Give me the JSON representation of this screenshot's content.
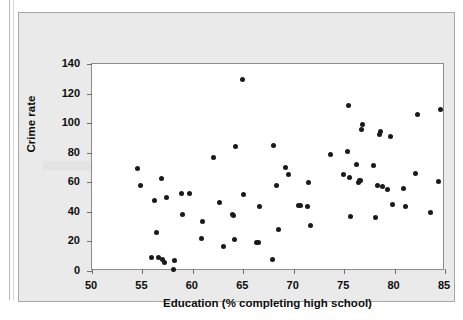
{
  "chart_data": {
    "type": "scatter",
    "title": "",
    "xlabel": "Education (% completing high school)",
    "ylabel": "Crime rate",
    "xlim": [
      50,
      85
    ],
    "ylim": [
      0,
      140
    ],
    "xticks": [
      50,
      55,
      60,
      65,
      70,
      75,
      80,
      85
    ],
    "yticks": [
      0,
      20,
      40,
      60,
      80,
      100,
      120,
      140
    ],
    "grid": false,
    "legend": null,
    "marker_color": "#1a1a1a",
    "plot_bg": "#ffffff",
    "panel_bg": "#ebeaea",
    "points": [
      [
        54.5,
        69
      ],
      [
        54.8,
        57.5
      ],
      [
        55.9,
        9
      ],
      [
        56.2,
        47.5
      ],
      [
        56.4,
        26
      ],
      [
        56.6,
        9
      ],
      [
        56.9,
        62.5
      ],
      [
        57.0,
        8
      ],
      [
        57.2,
        6
      ],
      [
        57.4,
        50
      ],
      [
        58.1,
        1
      ],
      [
        58.2,
        7
      ],
      [
        58.9,
        52.5
      ],
      [
        59.0,
        38
      ],
      [
        59.7,
        52.5
      ],
      [
        60.9,
        22
      ],
      [
        61.0,
        33.5
      ],
      [
        62.0,
        77
      ],
      [
        62.6,
        46
      ],
      [
        63.0,
        16.5
      ],
      [
        63.9,
        38
      ],
      [
        64.0,
        37.5
      ],
      [
        64.1,
        21
      ],
      [
        64.2,
        84
      ],
      [
        64.9,
        129.5
      ],
      [
        65.0,
        51.5
      ],
      [
        66.3,
        19.5
      ],
      [
        66.5,
        19
      ],
      [
        66.6,
        43.5
      ],
      [
        67.9,
        7.5
      ],
      [
        68.0,
        85
      ],
      [
        68.3,
        57.5
      ],
      [
        68.5,
        28
      ],
      [
        69.2,
        70
      ],
      [
        69.5,
        65
      ],
      [
        70.5,
        44.5
      ],
      [
        70.7,
        44
      ],
      [
        71.4,
        43.5
      ],
      [
        71.5,
        60
      ],
      [
        71.7,
        30.5
      ],
      [
        73.6,
        79
      ],
      [
        74.9,
        65.5
      ],
      [
        75.3,
        80.5
      ],
      [
        75.4,
        112
      ],
      [
        75.5,
        63.5
      ],
      [
        75.6,
        37
      ],
      [
        76.2,
        72
      ],
      [
        76.4,
        60
      ],
      [
        76.5,
        61
      ],
      [
        76.6,
        61.5
      ],
      [
        76.7,
        96
      ],
      [
        76.8,
        99
      ],
      [
        77.9,
        71.5
      ],
      [
        78.1,
        36
      ],
      [
        78.3,
        58
      ],
      [
        78.5,
        92.5
      ],
      [
        78.6,
        94.5
      ],
      [
        78.8,
        57
      ],
      [
        79.3,
        55
      ],
      [
        79.6,
        91
      ],
      [
        79.8,
        45
      ],
      [
        80.9,
        56
      ],
      [
        81.1,
        43.5
      ],
      [
        82.1,
        66
      ],
      [
        82.3,
        106
      ],
      [
        83.6,
        39.5
      ],
      [
        84.4,
        60.5
      ],
      [
        84.6,
        109.5
      ]
    ]
  },
  "axes": {
    "x_tick_labels": [
      "50",
      "55",
      "60",
      "65",
      "70",
      "75",
      "80",
      "85"
    ],
    "y_tick_labels": [
      "0",
      "20",
      "40",
      "60",
      "80",
      "100",
      "120",
      "140"
    ],
    "x_axis_title": "Education (% completing high school)",
    "y_axis_title": "Crime rate"
  }
}
